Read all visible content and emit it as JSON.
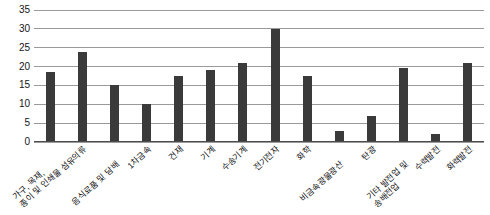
{
  "chart_data": {
    "type": "bar",
    "title": "",
    "subtitle": "",
    "xlabel": "",
    "ylabel": "",
    "ylim": [
      0,
      35
    ],
    "ytick_step": 5,
    "yticks": [
      "0",
      "5",
      "10",
      "15",
      "20",
      "25",
      "30",
      "35"
    ],
    "grid": "horizontal",
    "legend": "none",
    "bar_color": "#3a3a3a",
    "gridline_color": "#9a9a9a",
    "categories": [
      "가구, 목재,\n종이 및 인쇄물",
      "섬유의류",
      "음식료품 및 담배",
      "1차금속",
      "건재",
      "기계",
      "수송기계",
      "전기전자",
      "화학",
      "비금속광물광산",
      "탄광",
      "기타 발전업 및\n송배전업",
      "수력발전",
      "화력발전"
    ],
    "categories_display": [
      {
        "line1": "가구, 목재,",
        "line2": "종이 및 인쇄물",
        "row": "b"
      },
      {
        "line1": "섬유의류",
        "line2": "",
        "row": "a"
      },
      {
        "line1": "음식료품 및 담배",
        "line2": "",
        "row": "b"
      },
      {
        "line1": "1차금속",
        "line2": "",
        "row": "a"
      },
      {
        "line1": "건재",
        "line2": "",
        "row": "a"
      },
      {
        "line1": "기계",
        "line2": "",
        "row": "a"
      },
      {
        "line1": "수송기계",
        "line2": "",
        "row": "a"
      },
      {
        "line1": "전기전자",
        "line2": "",
        "row": "a"
      },
      {
        "line1": "화학",
        "line2": "",
        "row": "a"
      },
      {
        "line1": "비금속광물광산",
        "line2": "",
        "row": "b"
      },
      {
        "line1": "탄광",
        "line2": "",
        "row": "a"
      },
      {
        "line1": "기타 발전업 및",
        "line2": "송배전업",
        "row": "b"
      },
      {
        "line1": "수력발전",
        "line2": "",
        "row": "a"
      },
      {
        "line1": "화력발전",
        "line2": "",
        "row": "a"
      }
    ],
    "values": [
      18.5,
      24,
      15,
      10,
      17.5,
      19,
      21,
      30,
      17.5,
      3,
      7,
      19.5,
      2,
      21
    ]
  }
}
